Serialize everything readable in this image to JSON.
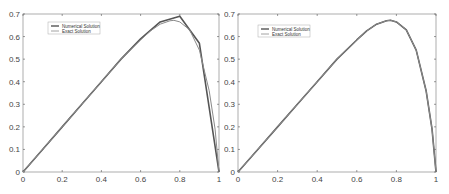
{
  "chart_data": [
    {
      "type": "line",
      "title": "",
      "xlabel": "",
      "ylabel": "",
      "xlim": [
        0,
        1
      ],
      "ylim": [
        0,
        0.7
      ],
      "xticks": [
        "0",
        "0.2",
        "0.4",
        "0.6",
        "0.8",
        "1"
      ],
      "yticks": [
        "0",
        "0.1",
        "0.2",
        "0.3",
        "0.4",
        "0.5",
        "0.6",
        "0.7"
      ],
      "grid": false,
      "legend_position": "upper left",
      "series": [
        {
          "name": "Numerical Solution",
          "x": [
            0,
            0.1,
            0.2,
            0.3,
            0.4,
            0.5,
            0.6,
            0.7,
            0.8,
            0.9,
            1.0
          ],
          "values": [
            0,
            0.1,
            0.2,
            0.3,
            0.4,
            0.5,
            0.59,
            0.665,
            0.69,
            0.57,
            0
          ]
        },
        {
          "name": "Exact Solution",
          "x": [
            0,
            0.1,
            0.2,
            0.3,
            0.4,
            0.5,
            0.6,
            0.65,
            0.7,
            0.75,
            0.77,
            0.8,
            0.85,
            0.9,
            0.95,
            0.98,
            1.0
          ],
          "values": [
            0,
            0.1,
            0.2,
            0.3,
            0.4,
            0.5,
            0.585,
            0.625,
            0.655,
            0.67,
            0.672,
            0.665,
            0.63,
            0.54,
            0.36,
            0.19,
            0
          ]
        }
      ]
    },
    {
      "type": "line",
      "title": "",
      "xlabel": "",
      "ylabel": "",
      "xlim": [
        0,
        1
      ],
      "ylim": [
        0,
        0.7
      ],
      "xticks": [
        "0",
        "0.2",
        "0.4",
        "0.6",
        "0.8",
        "1"
      ],
      "yticks": [
        "0",
        "0.1",
        "0.2",
        "0.3",
        "0.4",
        "0.5",
        "0.6",
        "0.7"
      ],
      "grid": false,
      "legend_position": "upper left",
      "series": [
        {
          "name": "Numerical Solution",
          "x": [
            0,
            0.1,
            0.2,
            0.3,
            0.4,
            0.5,
            0.6,
            0.65,
            0.7,
            0.75,
            0.77,
            0.8,
            0.85,
            0.9,
            0.95,
            0.98,
            1.0
          ],
          "values": [
            0,
            0.1,
            0.2,
            0.3,
            0.4,
            0.5,
            0.585,
            0.625,
            0.655,
            0.67,
            0.672,
            0.665,
            0.63,
            0.54,
            0.36,
            0.19,
            0
          ]
        },
        {
          "name": "Exact Solution",
          "x": [
            0,
            0.1,
            0.2,
            0.3,
            0.4,
            0.5,
            0.6,
            0.65,
            0.7,
            0.75,
            0.77,
            0.8,
            0.85,
            0.9,
            0.95,
            0.98,
            1.0
          ],
          "values": [
            0,
            0.1,
            0.2,
            0.3,
            0.4,
            0.5,
            0.585,
            0.625,
            0.655,
            0.67,
            0.672,
            0.665,
            0.63,
            0.54,
            0.36,
            0.19,
            0
          ]
        }
      ]
    }
  ],
  "panels": [
    {
      "legend": {
        "items": [
          "Numerical Solution",
          "Exact Solution"
        ]
      }
    },
    {
      "legend": {
        "items": [
          "Numerical Solution",
          "Exact Solution"
        ]
      }
    }
  ],
  "style": {
    "axis_color": "#999999",
    "numerical_color": "#555555",
    "exact_color": "#8a8a8a",
    "tick_color": "#555555"
  }
}
